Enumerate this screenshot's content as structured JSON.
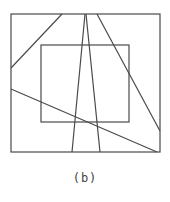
{
  "caption": "(b)",
  "colors": {
    "stroke": "#4a4a4a",
    "background": "#ffffff"
  },
  "diagram": {
    "outer_box": {
      "x1": 11,
      "y1": 14,
      "x2": 160,
      "y2": 152
    },
    "inner_box": {
      "x1": 41,
      "y1": 45,
      "x2": 129,
      "y2": 122
    },
    "lines": [
      {
        "name": "top-left-diagonal",
        "x1": 11,
        "y1": 68,
        "x2": 62,
        "y2": 14
      },
      {
        "name": "v-left-line",
        "x1": 85,
        "y1": 14,
        "x2": 72,
        "y2": 152
      },
      {
        "name": "v-right-line",
        "x1": 86,
        "y1": 14,
        "x2": 100,
        "y2": 152
      },
      {
        "name": "right-diagonal",
        "x1": 97,
        "y1": 14,
        "x2": 160,
        "y2": 131
      },
      {
        "name": "lower-diagonal",
        "x1": 11,
        "y1": 89,
        "x2": 157,
        "y2": 152
      }
    ]
  }
}
